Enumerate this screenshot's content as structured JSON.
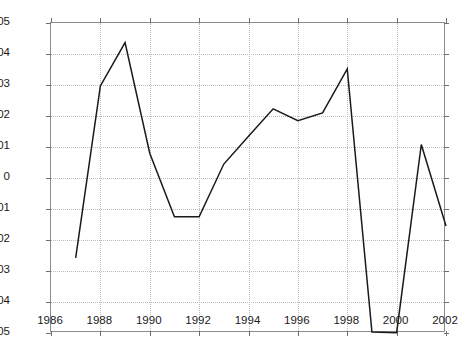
{
  "chart_data": {
    "type": "line",
    "title": "",
    "xlabel": "",
    "ylabel": "",
    "xlim": [
      1986,
      2002
    ],
    "ylim": [
      -0.05,
      0.05
    ],
    "grid": true,
    "legend": null,
    "x_ticks": [
      1986,
      1988,
      1990,
      1992,
      1994,
      1996,
      1998,
      2000,
      2002
    ],
    "x_tick_labels": [
      "1986",
      "1988",
      "1990",
      "1992",
      "1994",
      "1996",
      "1998",
      "2000",
      "2002"
    ],
    "y_ticks": [
      0.05,
      0.04,
      0.03,
      0.02,
      0.01,
      0,
      -0.01,
      -0.02,
      -0.03,
      -0.04,
      -0.05
    ],
    "y_tick_labels": [
      "0.05",
      "0.04",
      "0.03",
      "0.02",
      "0.01",
      "0",
      "-0.01",
      "-0.02",
      "-0.03",
      "-0.04",
      "-0.05"
    ],
    "line_color": "#1a1a1a",
    "grid_color": "#bdbdbd",
    "axes_color": "#8c8c8c",
    "x": [
      1987,
      1988,
      1989,
      1990,
      1991,
      1992,
      1993,
      1994,
      1995,
      1996,
      1997,
      1998,
      1999,
      2000,
      2001,
      2002
    ],
    "values": [
      -0.0258,
      0.0297,
      0.0437,
      0.008,
      -0.0125,
      -0.0125,
      0.0045,
      0.0135,
      0.0223,
      0.0185,
      0.021,
      0.0352,
      -0.0497,
      -0.0499,
      0.0108,
      -0.0155
    ]
  }
}
